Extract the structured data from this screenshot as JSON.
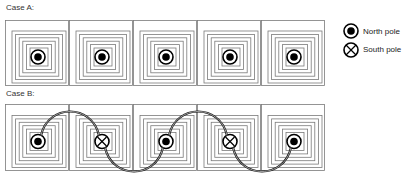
{
  "cases": [
    {
      "label": "Case A:",
      "poles": [
        "north",
        "north",
        "north",
        "north",
        "north"
      ]
    },
    {
      "label": "Case B:",
      "poles": [
        "north",
        "south",
        "north",
        "south",
        "north"
      ]
    }
  ],
  "legend": {
    "north": {
      "label": "North pole",
      "icon": "filled-dot-in-circle"
    },
    "south": {
      "label": "South pole",
      "icon": "x-in-circle"
    }
  },
  "colors": {
    "coil": "#7a7a7a",
    "symbol": "#000000",
    "connector": "#111111",
    "text": "#333333"
  }
}
